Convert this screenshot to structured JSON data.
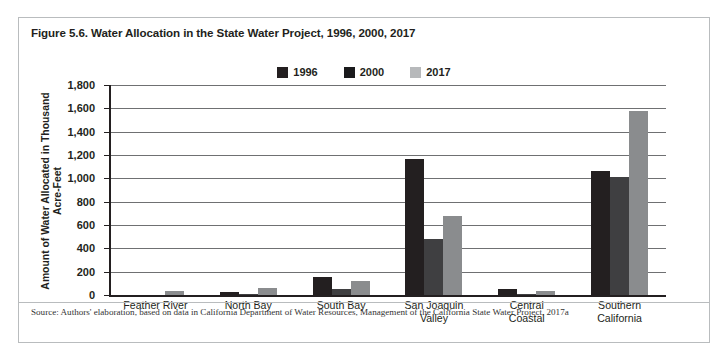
{
  "figure": {
    "title": "Figure 5.6. Water Allocation in the State Water Project, 1996, 2000, 2017",
    "source": "Source: Authors' elaboration, based on data in California Department of Water Resources, Management of the California State Water Project, 2017a"
  },
  "colors": {
    "series_1996": "#231f20",
    "series_2000": "#3f3f41",
    "series_2017": "#8a8c8e",
    "gridline": "#6f7072",
    "axis": "#231f20",
    "frame": "#b9bcbe",
    "background": "#ffffff"
  },
  "legend": {
    "position": "top-center",
    "items": [
      {
        "label": "1996",
        "swatch": "legend-swatch-1996",
        "color": "#231f20"
      },
      {
        "label": "2000",
        "swatch": "legend-swatch-2000",
        "color": "#3f3f41"
      },
      {
        "label": "2017",
        "swatch": "legend-swatch-2017",
        "color": "#8a8c8e"
      }
    ]
  },
  "chart_data": {
    "type": "bar",
    "title": "Figure 5.6. Water Allocation in the State Water Project, 1996, 2000, 2017",
    "xlabel": "",
    "ylabel": "Amount of Water Allocated in Thousand Acre-Feet",
    "ylim": [
      0,
      1800
    ],
    "ytick_step": 200,
    "ytick_labels": [
      "0",
      "200",
      "400",
      "600",
      "800",
      "1,000",
      "1,200",
      "1,400",
      "1,600",
      "1,800"
    ],
    "ytick_values": [
      0,
      200,
      400,
      600,
      800,
      1000,
      1200,
      1400,
      1600,
      1800
    ],
    "grid": true,
    "grid_axis": "y",
    "legend_position": "top-center",
    "categories": [
      "Feather River",
      "North Bay",
      "South Bay",
      "San Joaquin Valley",
      "Central Coastal",
      "Southern California"
    ],
    "category_lines": [
      [
        "Feather River"
      ],
      [
        "North Bay"
      ],
      [
        "South Bay"
      ],
      [
        "San Joaquin",
        "Valley"
      ],
      [
        "Central",
        "Coastal"
      ],
      [
        "Southern",
        "California"
      ]
    ],
    "series": [
      {
        "name": "1996",
        "color": "#231f20",
        "values": [
          0,
          30,
          155,
          1170,
          50,
          1065
        ]
      },
      {
        "name": "2000",
        "color": "#3f3f41",
        "values": [
          0,
          10,
          55,
          480,
          4,
          1015
        ]
      },
      {
        "name": "2017",
        "color": "#8a8c8e",
        "values": [
          38,
          60,
          120,
          680,
          35,
          1575
        ]
      }
    ]
  }
}
